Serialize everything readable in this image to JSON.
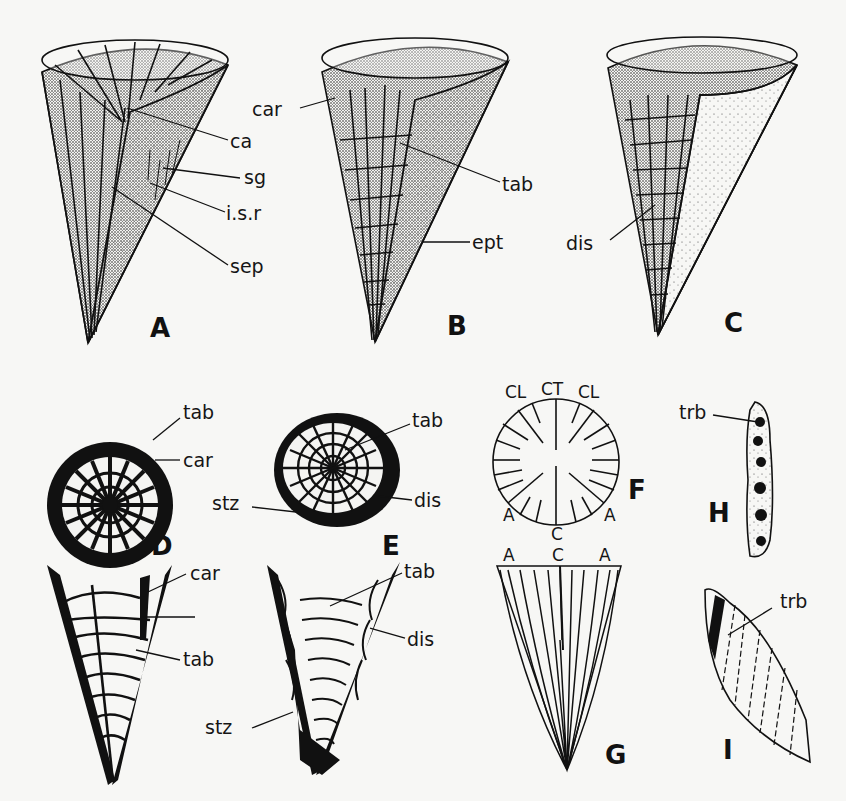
{
  "figure": {
    "panels": {
      "A": {
        "letter": "A",
        "labels": {
          "ca": "ca",
          "sg": "sg",
          "isr": "i.s.r",
          "sep": "sep"
        }
      },
      "B": {
        "letter": "B",
        "labels": {
          "car": "car",
          "tab": "tab",
          "ept": "ept"
        }
      },
      "C": {
        "letter": "C",
        "labels": {
          "dis": "dis"
        }
      },
      "D": {
        "letter": "D",
        "labels": {
          "tab": "tab",
          "car": "car"
        }
      },
      "E": {
        "letter": "E",
        "labels": {
          "tab": "tab",
          "dis": "dis",
          "stz": "stz"
        }
      },
      "F": {
        "letter": "F",
        "labels": {
          "cl_left": "CL",
          "ct": "CT",
          "cl_right": "CL",
          "a_left": "A",
          "c": "C",
          "a_right": "A"
        }
      },
      "G": {
        "letter": "G",
        "labels": {
          "a_left": "A",
          "c": "C",
          "a_right": "A"
        }
      },
      "H": {
        "letter": "H",
        "labels": {
          "trb": "trb"
        }
      },
      "I": {
        "letter": "I",
        "labels": {
          "trb": "trb"
        }
      },
      "D_long": {
        "labels": {
          "car": "car",
          "tab": "tab"
        }
      },
      "E_long": {
        "labels": {
          "tab": "tab",
          "dis": "dis",
          "stz": "stz"
        }
      }
    },
    "colors": {
      "ink": "#111111",
      "paper": "#f7f7f5",
      "stipple": "#555555"
    }
  }
}
